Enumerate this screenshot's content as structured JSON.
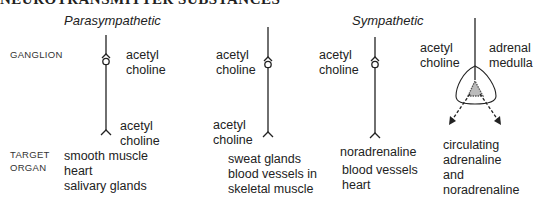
{
  "title": "NEUROTRANSMITTER SUBSTANCES",
  "headings": {
    "parasympathetic": "Parasympathetic",
    "sympathetic": "Sympathetic"
  },
  "row_labels": {
    "ganglion": "GANGLION",
    "target_organ_line1": "TARGET",
    "target_organ_line2": "ORGAN"
  },
  "pathways": [
    {
      "name": "parasympathetic",
      "ganglion_transmitter": [
        "acetyl",
        "choline"
      ],
      "target_transmitter": [
        "acetyl",
        "choline"
      ],
      "target_organs": [
        "smooth muscle",
        "heart",
        "salivary glands"
      ]
    },
    {
      "name": "sympathetic-cholinergic",
      "ganglion_transmitter": [
        "acetyl",
        "choline"
      ],
      "target_transmitter": [
        "acetyl",
        "choline"
      ],
      "target_organs": [
        "sweat glands",
        "blood vessels in",
        "skeletal muscle"
      ]
    },
    {
      "name": "sympathetic-adrenergic",
      "ganglion_transmitter": [
        "acetyl",
        "choline"
      ],
      "target_transmitter": [
        "noradrenaline"
      ],
      "target_organs": [
        "blood vessels",
        "heart"
      ]
    },
    {
      "name": "adrenal-medulla",
      "ganglion_transmitter": [
        "acetyl",
        "choline"
      ],
      "organ_label": [
        "adrenal",
        "medulla"
      ],
      "output": [
        "circulating",
        "adrenaline",
        "and",
        "noradrenaline"
      ]
    }
  ]
}
